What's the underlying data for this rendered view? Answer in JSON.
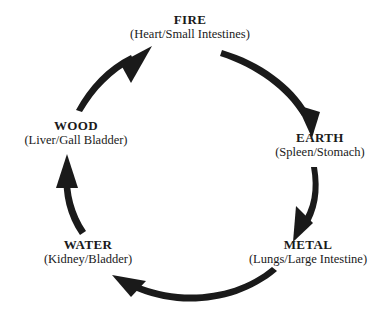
{
  "diagram": {
    "type": "five-element-cycle",
    "background_color": "#ffffff",
    "stroke_color": "#1a1a1a",
    "text_color": "#1a1a1a",
    "direction": "clockwise",
    "nodes": [
      {
        "id": "fire",
        "name": "FIRE",
        "organs": "(Heart/Small Intestines)"
      },
      {
        "id": "earth",
        "name": "EARTH",
        "organs": "(Spleen/Stomach)"
      },
      {
        "id": "metal",
        "name": "METAL",
        "organs": "(Lungs/Large Intestine)"
      },
      {
        "id": "water",
        "name": "WATER",
        "organs": "(Kidney/Bladder)"
      },
      {
        "id": "wood",
        "name": "WOOD",
        "organs": "(Liver/Gall Bladder)"
      }
    ],
    "arrows": [
      {
        "id": "fire-to-earth",
        "from": "FIRE",
        "to": "EARTH"
      },
      {
        "id": "earth-to-metal",
        "from": "EARTH",
        "to": "METAL"
      },
      {
        "id": "metal-to-water",
        "from": "METAL",
        "to": "WATER"
      },
      {
        "id": "water-to-wood",
        "from": "WATER",
        "to": "WOOD"
      },
      {
        "id": "wood-to-fire",
        "from": "WOOD",
        "to": "FIRE"
      }
    ]
  }
}
